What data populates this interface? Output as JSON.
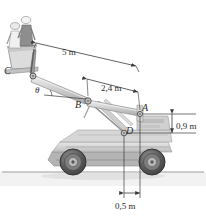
{
  "figure": {
    "background_color": "#ffffff",
    "line_color": "#3a3a3a",
    "machine_fill_light": "#e2e2e2",
    "machine_fill_mid": "#c9c9c9",
    "machine_fill_dark": "#a8a8a8",
    "ground_color": "#b9b9b9",
    "tire_color": "#4a4a4a"
  },
  "points": {
    "C": "C",
    "B": "B",
    "A": "A",
    "D": "D"
  },
  "angle": {
    "theta": "θ"
  },
  "dimensions": {
    "boom_CA": "5 m",
    "boom_BA": "2,4 m",
    "height_AD": "0,9 m",
    "offset_D": "0,5 m"
  }
}
